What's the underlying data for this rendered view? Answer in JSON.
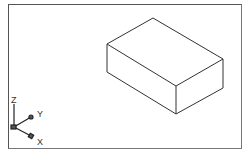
{
  "viewport": {
    "view": "SE Isometric",
    "background": "#ffffff",
    "line_color": "#333333"
  },
  "box": {
    "edges": [
      {
        "from": [
          153,
          18
        ],
        "to": [
          223,
          59
        ]
      },
      {
        "from": [
          153,
          18
        ],
        "to": [
          107,
          44
        ]
      },
      {
        "from": [
          107,
          44
        ],
        "to": [
          176,
          86
        ]
      },
      {
        "from": [
          223,
          59
        ],
        "to": [
          176,
          86
        ]
      },
      {
        "from": [
          107,
          44
        ],
        "to": [
          107,
          72
        ]
      },
      {
        "from": [
          176,
          86
        ],
        "to": [
          176,
          114
        ]
      },
      {
        "from": [
          223,
          59
        ],
        "to": [
          223,
          88
        ]
      },
      {
        "from": [
          107,
          72
        ],
        "to": [
          176,
          114
        ]
      },
      {
        "from": [
          176,
          114
        ],
        "to": [
          223,
          88
        ]
      }
    ]
  },
  "ucs_icon": {
    "z_label": "Z",
    "y_label": "Y",
    "x_label": "X"
  }
}
